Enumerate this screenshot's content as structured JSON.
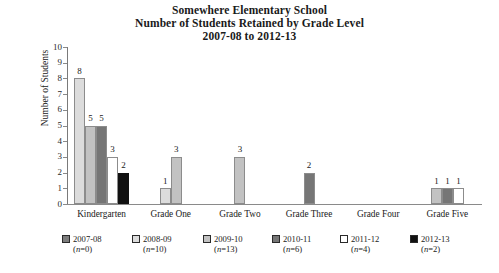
{
  "chart_data": {
    "type": "bar",
    "title": "Somewhere Elementary School\nNumber of Students Retained by Grade Level\n2007-08 to 2012-13",
    "title_lines": [
      "Somewhere Elementary School",
      "Number of Students Retained by Grade Level",
      "2007-08 to 2012-13"
    ],
    "xlabel": "",
    "ylabel": "Number of Students",
    "ylim": [
      0,
      10
    ],
    "yticks": [
      0,
      1,
      2,
      3,
      4,
      5,
      6,
      7,
      8,
      9,
      10
    ],
    "ytick_labels": [
      "0",
      "1",
      "2",
      "3",
      "4",
      "5",
      "6",
      "7",
      "8",
      "9",
      "10"
    ],
    "grid": false,
    "legend_position": "bottom",
    "categories": [
      "Kindergarten",
      "Grade One",
      "Grade Two",
      "Grade Three",
      "Grade Four",
      "Grade Five"
    ],
    "series": [
      {
        "name": "2007-08",
        "n": 0,
        "color": "#7d7d7d",
        "values": [
          null,
          null,
          null,
          null,
          null,
          null
        ]
      },
      {
        "name": "2008-09",
        "n": 10,
        "color": "#dcdcdc",
        "values": [
          8,
          1,
          null,
          null,
          null,
          null
        ]
      },
      {
        "name": "2009-10",
        "n": 13,
        "color": "#c2c2c2",
        "values": [
          5,
          3,
          3,
          null,
          null,
          1
        ]
      },
      {
        "name": "2010-11",
        "n": 6,
        "color": "#767676",
        "values": [
          5,
          null,
          null,
          2,
          null,
          1
        ]
      },
      {
        "name": "2011-12",
        "n": 4,
        "color": "#ffffff",
        "values": [
          3,
          null,
          null,
          null,
          null,
          1
        ]
      },
      {
        "name": "2012-13",
        "n": 2,
        "color": "#111111",
        "values": [
          2,
          null,
          null,
          null,
          null,
          null
        ]
      }
    ]
  },
  "legend": {
    "items": [
      {
        "label": "2007-08",
        "n_text": "(n=0)"
      },
      {
        "label": "2008-09",
        "n_text": "(n=10)"
      },
      {
        "label": "2009-10",
        "n_text": "(n=13)"
      },
      {
        "label": "2010-11",
        "n_text": "(n=6)"
      },
      {
        "label": "2011-12",
        "n_text": "(n=4)"
      },
      {
        "label": "2012-13",
        "n_text": "(n=2)"
      }
    ]
  }
}
